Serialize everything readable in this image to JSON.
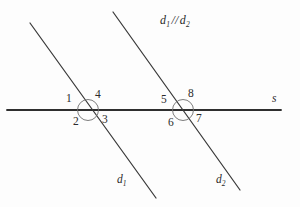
{
  "figure": {
    "kind": "parallel-lines-transversal-diagram",
    "background_color": "#fdfdfd",
    "stroke_color": "#2f2f2f",
    "relation_text_d": "d",
    "relation_sub_1": "1",
    "relation_parallel_symbol": "//",
    "relation_sub_2": "2",
    "transversal_label": "s",
    "line1_label_d": "d",
    "line1_label_sub": "1",
    "line2_label_d": "d",
    "line2_label_sub": "2",
    "angles": [
      {
        "id": "angle-1",
        "text": "1",
        "x": 66,
        "y": 93
      },
      {
        "id": "angle-2",
        "text": "2",
        "x": 73,
        "y": 116
      },
      {
        "id": "angle-3",
        "text": "3",
        "x": 102,
        "y": 114
      },
      {
        "id": "angle-4",
        "text": "4",
        "x": 95,
        "y": 89
      },
      {
        "id": "angle-5",
        "text": "5",
        "x": 161,
        "y": 94
      },
      {
        "id": "angle-6",
        "text": "6",
        "x": 168,
        "y": 117
      },
      {
        "id": "angle-7",
        "text": "7",
        "x": 196,
        "y": 113
      },
      {
        "id": "angle-8",
        "text": "8",
        "x": 188,
        "y": 88
      }
    ],
    "geometry": {
      "transversal": {
        "x1": 7,
        "y1": 110,
        "x2": 281,
        "y2": 110
      },
      "line_d1": {
        "x1": 30,
        "y1": 23,
        "x2": 156,
        "y2": 198
      },
      "line_d2": {
        "x1": 113,
        "y1": 12,
        "x2": 240,
        "y2": 190
      },
      "circle_left": {
        "cx": 88,
        "cy": 110,
        "r": 10.5
      },
      "circle_right": {
        "cx": 183,
        "cy": 110,
        "r": 10.5
      }
    }
  }
}
